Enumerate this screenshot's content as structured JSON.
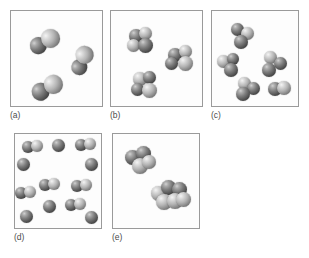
{
  "figure": {
    "cut_off_header_text": "",
    "background_color": "#ffffff",
    "border_color": "#9a9a9a",
    "label_color": "#4c4c4c",
    "atom_color_dark": "#2e2e2e",
    "atom_color_mid": "#7c7c7c",
    "atom_color_light": "#dcdcdc"
  },
  "panels": [
    {
      "id": "a",
      "label": "(a)",
      "box": {
        "x": 10,
        "y": 10,
        "w": 93,
        "h": 97
      },
      "label_pos": {
        "x": 10,
        "y": 110
      },
      "species_description": "three identical diatomic molecules",
      "molecule_count": 3,
      "molecules": [
        {
          "x": 18,
          "y": 20,
          "w": 34,
          "h": 22,
          "type": "diatomic",
          "rot": -22,
          "atoms": [
            {
              "x": 0,
              "y": 3,
              "d": 17,
              "shade": "dark"
            },
            {
              "x": 13,
              "y": 0,
              "d": 19,
              "shade": "light"
            }
          ]
        },
        {
          "x": 57,
          "y": 38,
          "w": 28,
          "h": 24,
          "type": "diatomic",
          "rot": -40,
          "atoms": [
            {
              "x": 0,
              "y": 7,
              "d": 16,
              "shade": "dark"
            },
            {
              "x": 11,
              "y": 0,
              "d": 18,
              "shade": "light"
            }
          ]
        },
        {
          "x": 20,
          "y": 66,
          "w": 34,
          "h": 23,
          "type": "diatomic",
          "rot": -20,
          "atoms": [
            {
              "x": 0,
              "y": 3,
              "d": 18,
              "shade": "dark"
            },
            {
              "x": 14,
              "y": 0,
              "d": 19,
              "shade": "light"
            }
          ]
        }
      ]
    },
    {
      "id": "b",
      "label": "(b)",
      "box": {
        "x": 110,
        "y": 10,
        "w": 93,
        "h": 97
      },
      "label_pos": {
        "x": 110,
        "y": 110
      },
      "species_description": "three identical polyatomic (tetrahedral) molecules",
      "molecule_count": 3,
      "molecules": [
        {
          "x": 16,
          "y": 16,
          "w": 28,
          "h": 28,
          "type": "polyatomic",
          "rot": 0,
          "atoms": [
            {
              "x": 2,
              "y": 2,
              "d": 14,
              "shade": "dark"
            },
            {
              "x": 12,
              "y": 0,
              "d": 13,
              "shade": "light"
            },
            {
              "x": 0,
              "y": 12,
              "d": 13,
              "shade": "light"
            },
            {
              "x": 11,
              "y": 11,
              "d": 15,
              "shade": "dark"
            }
          ]
        },
        {
          "x": 54,
          "y": 34,
          "w": 30,
          "h": 27,
          "type": "polyatomic",
          "rot": 0,
          "atoms": [
            {
              "x": 3,
              "y": 3,
              "d": 14,
              "shade": "dark"
            },
            {
              "x": 14,
              "y": 0,
              "d": 13,
              "shade": "light"
            },
            {
              "x": 0,
              "y": 12,
              "d": 13,
              "shade": "dark"
            },
            {
              "x": 13,
              "y": 11,
              "d": 15,
              "shade": "light"
            }
          ]
        },
        {
          "x": 20,
          "y": 60,
          "w": 28,
          "h": 28,
          "type": "polyatomic",
          "rot": 0,
          "atoms": [
            {
              "x": 2,
              "y": 1,
              "d": 14,
              "shade": "light"
            },
            {
              "x": 12,
              "y": 0,
              "d": 13,
              "shade": "dark"
            },
            {
              "x": 0,
              "y": 12,
              "d": 13,
              "shade": "dark"
            },
            {
              "x": 11,
              "y": 12,
              "d": 15,
              "shade": "light"
            }
          ]
        }
      ]
    },
    {
      "id": "c",
      "label": "(c)",
      "box": {
        "x": 211,
        "y": 10,
        "w": 88,
        "h": 97
      },
      "label_pos": {
        "x": 211,
        "y": 110
      },
      "species_description": "five identical triatomic (bent) molecules",
      "molecule_count": 5,
      "molecules": [
        {
          "x": 18,
          "y": 12,
          "w": 26,
          "h": 26,
          "type": "triatomic",
          "rot": 0,
          "atoms": [
            {
              "x": 1,
              "y": 0,
              "d": 13,
              "shade": "dark"
            },
            {
              "x": 11,
              "y": 4,
              "d": 13,
              "shade": "light"
            },
            {
              "x": 4,
              "y": 12,
              "d": 14,
              "shade": "dark"
            }
          ]
        },
        {
          "x": 5,
          "y": 42,
          "w": 25,
          "h": 24,
          "type": "triatomic",
          "rot": 0,
          "atoms": [
            {
              "x": 0,
              "y": 2,
              "d": 13,
              "shade": "light"
            },
            {
              "x": 10,
              "y": 0,
              "d": 12,
              "shade": "dark"
            },
            {
              "x": 7,
              "y": 10,
              "d": 14,
              "shade": "dark"
            }
          ]
        },
        {
          "x": 50,
          "y": 40,
          "w": 26,
          "h": 27,
          "type": "triatomic",
          "rot": 0,
          "atoms": [
            {
              "x": 2,
              "y": 0,
              "d": 13,
              "shade": "light"
            },
            {
              "x": 12,
              "y": 6,
              "d": 13,
              "shade": "dark"
            },
            {
              "x": 0,
              "y": 12,
              "d": 14,
              "shade": "dark"
            }
          ]
        },
        {
          "x": 24,
          "y": 66,
          "w": 26,
          "h": 25,
          "type": "triatomic",
          "rot": 0,
          "atoms": [
            {
              "x": 2,
              "y": 0,
              "d": 13,
              "shade": "light"
            },
            {
              "x": 11,
              "y": 5,
              "d": 13,
              "shade": "dark"
            },
            {
              "x": 0,
              "y": 10,
              "d": 14,
              "shade": "dark"
            }
          ]
        },
        {
          "x": 56,
          "y": 70,
          "w": 24,
          "h": 21,
          "type": "diatomic",
          "rot": 0,
          "atoms": [
            {
              "x": 0,
              "y": 1,
              "d": 14,
              "shade": "dark"
            },
            {
              "x": 9,
              "y": 0,
              "d": 14,
              "shade": "light"
            }
          ]
        }
      ]
    },
    {
      "id": "d",
      "label": "(d)",
      "box": {
        "x": 14,
        "y": 133,
        "w": 88,
        "h": 96
      },
      "label_pos": {
        "x": 14,
        "y": 232
      },
      "species_description": "mixture of single atoms and diatomic molecules",
      "molecule_count": 14,
      "molecules": [
        {
          "x": 7,
          "y": 6,
          "w": 24,
          "h": 15,
          "type": "diatomic",
          "atoms": [
            {
              "x": 0,
              "y": 1,
              "d": 12,
              "shade": "dark"
            },
            {
              "x": 9,
              "y": 0,
              "d": 12,
              "shade": "light"
            }
          ]
        },
        {
          "x": 37,
          "y": 5,
          "w": 14,
          "h": 14,
          "type": "atom",
          "atoms": [
            {
              "x": 0,
              "y": 0,
              "d": 13,
              "shade": "dark"
            }
          ]
        },
        {
          "x": 60,
          "y": 4,
          "w": 24,
          "h": 15,
          "type": "diatomic",
          "atoms": [
            {
              "x": 0,
              "y": 1,
              "d": 12,
              "shade": "dark"
            },
            {
              "x": 9,
              "y": 0,
              "d": 12,
              "shade": "light"
            }
          ]
        },
        {
          "x": 2,
          "y": 24,
          "w": 14,
          "h": 14,
          "type": "atom",
          "atoms": [
            {
              "x": 0,
              "y": 0,
              "d": 13,
              "shade": "dark"
            }
          ]
        },
        {
          "x": 70,
          "y": 24,
          "w": 14,
          "h": 14,
          "type": "atom",
          "atoms": [
            {
              "x": 0,
              "y": 0,
              "d": 13,
              "shade": "dark"
            }
          ]
        },
        {
          "x": 24,
          "y": 44,
          "w": 24,
          "h": 15,
          "type": "diatomic",
          "atoms": [
            {
              "x": 0,
              "y": 1,
              "d": 12,
              "shade": "dark"
            },
            {
              "x": 9,
              "y": 0,
              "d": 12,
              "shade": "light"
            }
          ]
        },
        {
          "x": 56,
          "y": 45,
          "w": 24,
          "h": 15,
          "type": "diatomic",
          "atoms": [
            {
              "x": 0,
              "y": 1,
              "d": 12,
              "shade": "dark"
            },
            {
              "x": 9,
              "y": 0,
              "d": 12,
              "shade": "light"
            }
          ]
        },
        {
          "x": 0,
          "y": 52,
          "w": 24,
          "h": 15,
          "type": "diatomic",
          "atoms": [
            {
              "x": 0,
              "y": 1,
              "d": 12,
              "shade": "dark"
            },
            {
              "x": 9,
              "y": 0,
              "d": 12,
              "shade": "light"
            }
          ]
        },
        {
          "x": 28,
          "y": 66,
          "w": 14,
          "h": 14,
          "type": "atom",
          "atoms": [
            {
              "x": 0,
              "y": 0,
              "d": 13,
              "shade": "dark"
            }
          ]
        },
        {
          "x": 50,
          "y": 64,
          "w": 24,
          "h": 15,
          "type": "diatomic",
          "atoms": [
            {
              "x": 0,
              "y": 1,
              "d": 12,
              "shade": "dark"
            },
            {
              "x": 9,
              "y": 0,
              "d": 12,
              "shade": "light"
            }
          ]
        },
        {
          "x": 5,
          "y": 76,
          "w": 14,
          "h": 14,
          "type": "atom",
          "atoms": [
            {
              "x": 0,
              "y": 0,
              "d": 13,
              "shade": "dark"
            }
          ]
        },
        {
          "x": 70,
          "y": 77,
          "w": 14,
          "h": 14,
          "type": "atom",
          "atoms": [
            {
              "x": 0,
              "y": 0,
              "d": 13,
              "shade": "dark"
            }
          ]
        }
      ]
    },
    {
      "id": "e",
      "label": "(e)",
      "box": {
        "x": 112,
        "y": 133,
        "w": 88,
        "h": 96
      },
      "label_pos": {
        "x": 112,
        "y": 232
      },
      "species_description": "two identical large polyatomic clusters",
      "molecule_count": 2,
      "molecules": [
        {
          "x": 12,
          "y": 12,
          "w": 32,
          "h": 30,
          "type": "cluster",
          "atoms": [
            {
              "x": 0,
              "y": 4,
              "d": 15,
              "shade": "dark"
            },
            {
              "x": 11,
              "y": 0,
              "d": 15,
              "shade": "dark"
            },
            {
              "x": 7,
              "y": 12,
              "d": 16,
              "shade": "light"
            },
            {
              "x": 17,
              "y": 9,
              "d": 14,
              "shade": "light"
            }
          ]
        },
        {
          "x": 38,
          "y": 46,
          "w": 40,
          "h": 32,
          "type": "cluster",
          "atoms": [
            {
              "x": 0,
              "y": 6,
              "d": 15,
              "shade": "light"
            },
            {
              "x": 10,
              "y": 0,
              "d": 15,
              "shade": "dark"
            },
            {
              "x": 21,
              "y": 2,
              "d": 15,
              "shade": "dark"
            },
            {
              "x": 5,
              "y": 14,
              "d": 16,
              "shade": "light"
            },
            {
              "x": 16,
              "y": 13,
              "d": 16,
              "shade": "light"
            },
            {
              "x": 25,
              "y": 12,
              "d": 15,
              "shade": "light"
            }
          ]
        }
      ]
    }
  ]
}
